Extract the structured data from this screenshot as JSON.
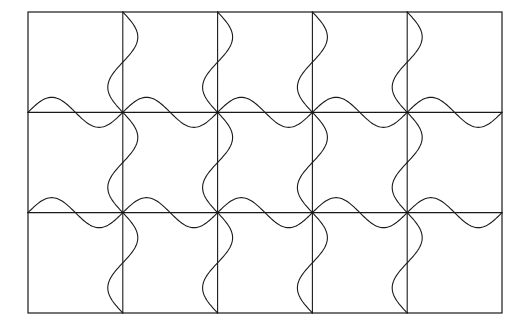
{
  "figure": {
    "alt_text": "5 by 3 rectangular grid with sine waves drawn along every interior horizontal and vertical grid line",
    "background_color": "#ffffff",
    "stroke_color": "#1a1a1a",
    "wave_stroke_color": "#1a1a1a",
    "border_stroke_width": "1.2",
    "grid_stroke_width": "1.1",
    "wave_stroke_width": "1.1"
  },
  "chart_data": {
    "type": "line",
    "title": "",
    "xlabel": "",
    "ylabel": "",
    "grid": true,
    "legend": "none",
    "xlim": [
      28,
      502
    ],
    "ylim": [
      12,
      313
    ],
    "geometry": {
      "origin_x": 28,
      "origin_y": 12,
      "width": 474,
      "height": 301,
      "columns": 5,
      "rows": 3,
      "cell_width": 94.8,
      "cell_height": 100.33,
      "x_gridlines": [
        28,
        122.8,
        217.6,
        312.4,
        407.2,
        502
      ],
      "y_gridlines": [
        12,
        112.33,
        212.67,
        313
      ]
    },
    "wave": {
      "amplitude": 15,
      "period_cells": 1,
      "phase": "starts at gridline, first lobe positive",
      "samples_per_period": 64,
      "horizontal_wave_rows": [
        112.33,
        212.67
      ],
      "vertical_wave_columns": [
        122.8,
        217.6,
        312.4,
        407.2
      ]
    },
    "series": [
      {
        "name": "horizontal-wave-row-1",
        "orientation": "horizontal",
        "axis_position": 112.33,
        "x_start": 28,
        "x_end": 502,
        "amplitude": 15,
        "period": 94.8
      },
      {
        "name": "horizontal-wave-row-2",
        "orientation": "horizontal",
        "axis_position": 212.67,
        "x_start": 28,
        "x_end": 502,
        "amplitude": 15,
        "period": 94.8
      },
      {
        "name": "vertical-wave-col-1",
        "orientation": "vertical",
        "axis_position": 122.8,
        "y_start": 12,
        "y_end": 313,
        "amplitude": 15,
        "period": 100.33
      },
      {
        "name": "vertical-wave-col-2",
        "orientation": "vertical",
        "axis_position": 217.6,
        "y_start": 12,
        "y_end": 313,
        "amplitude": 15,
        "period": 100.33
      },
      {
        "name": "vertical-wave-col-3",
        "orientation": "vertical",
        "axis_position": 312.4,
        "y_start": 12,
        "y_end": 313,
        "amplitude": 15,
        "period": 100.33
      },
      {
        "name": "vertical-wave-col-4",
        "orientation": "vertical",
        "axis_position": 407.2,
        "y_start": 12,
        "y_end": 313,
        "amplitude": 15,
        "period": 100.33
      }
    ]
  }
}
